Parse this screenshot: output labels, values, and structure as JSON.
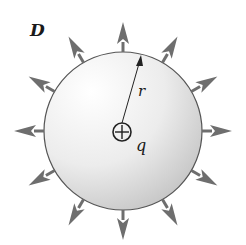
{
  "diagram": {
    "title": "",
    "labels": {
      "field": "D",
      "radius": "r",
      "charge": "q"
    },
    "charge_symbol": "plus",
    "sphere": {
      "cx": 123,
      "cy": 131,
      "r": 79
    },
    "arrows": {
      "count": 12,
      "angle_step_deg": 30,
      "length": 26,
      "color": "#6e6e6e"
    },
    "colors": {
      "sphere_fill_light": "#ffffff",
      "sphere_fill_dark": "#c8c8c8",
      "outline": "#555555",
      "arrow": "#6e6e6e",
      "text": "#1a1a1a"
    }
  }
}
